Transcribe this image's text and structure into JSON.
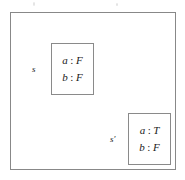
{
  "figure": {
    "name": "state-valuation-diagram",
    "background_color": "#ffffff",
    "outer_frame_color": "#888888",
    "box_border_color": "#8a8a8a",
    "text_color": "#1a1a1a",
    "separator": ":"
  },
  "states": [
    {
      "id": "s",
      "label": "s",
      "assignments": [
        {
          "variable": "a",
          "separator": ":",
          "value": "F"
        },
        {
          "variable": "b",
          "separator": ":",
          "value": "F"
        }
      ]
    },
    {
      "id": "s-prime",
      "label": "s′",
      "assignments": [
        {
          "variable": "a",
          "separator": ":",
          "value": "T"
        },
        {
          "variable": "b",
          "separator": ":",
          "value": "F"
        }
      ]
    }
  ]
}
